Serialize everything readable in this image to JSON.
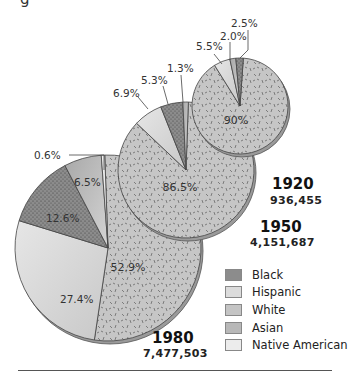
{
  "title_fragment": "g",
  "chart_data": {
    "type": "pie",
    "title": "",
    "legend": {
      "position": "bottom-right",
      "entries": [
        "Black",
        "Hispanic",
        "White",
        "Asian",
        "Native American"
      ]
    },
    "colors": {
      "Black": "#7a7a7a",
      "Hispanic": "#d8d8d8",
      "White": "#c4c4c4",
      "Asian": "#b4b4b4",
      "Native American": "#ececec"
    },
    "charts": [
      {
        "year": "1920",
        "total": "936,455",
        "slices": [
          {
            "group": "White",
            "value": 90.0,
            "label": "90%"
          },
          {
            "group": "Hispanic",
            "value": 5.5,
            "label": "5.5%"
          },
          {
            "group": "Asian",
            "value": 2.0,
            "label": "2.0%"
          },
          {
            "group": "Black",
            "value": 2.5,
            "label": "2.5%"
          }
        ]
      },
      {
        "year": "1950",
        "total": "4,151,687",
        "slices": [
          {
            "group": "White",
            "value": 86.5,
            "label": "86.5%"
          },
          {
            "group": "Hispanic",
            "value": 6.9,
            "label": "6.9%"
          },
          {
            "group": "Black",
            "value": 5.3,
            "label": "5.3%"
          },
          {
            "group": "Asian",
            "value": 1.3,
            "label": "1.3%"
          }
        ]
      },
      {
        "year": "1980",
        "total": "7,477,503",
        "slices": [
          {
            "group": "White",
            "value": 52.9,
            "label": "52.9%"
          },
          {
            "group": "Hispanic",
            "value": 27.4,
            "label": "27.4%"
          },
          {
            "group": "Black",
            "value": 12.6,
            "label": "12.6%"
          },
          {
            "group": "Asian",
            "value": 6.5,
            "label": "6.5%"
          },
          {
            "group": "Native American",
            "value": 0.6,
            "label": "0.6%"
          }
        ]
      }
    ]
  },
  "labels": {
    "y1920": "1920",
    "t1920": "936,455",
    "y1950": "1950",
    "t1950": "4,151,687",
    "y1980": "1980",
    "t1980": "7,477,503"
  },
  "legend_labels": [
    "Black",
    "Hispanic",
    "White",
    "Asian",
    "Native American"
  ]
}
